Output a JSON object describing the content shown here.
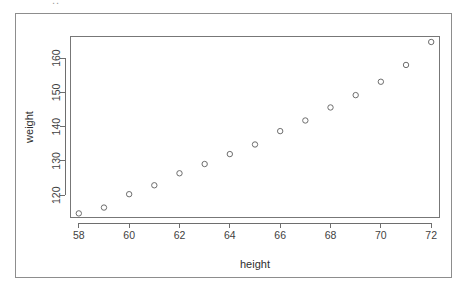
{
  "figure": {
    "top_fragment_text": "..",
    "background_color": "#ffffff",
    "frame_color": "#8d8d8d"
  },
  "chart_data": {
    "type": "scatter",
    "title": "",
    "xlabel": "height",
    "ylabel": "weight",
    "x": [
      58,
      59,
      60,
      61,
      62,
      63,
      64,
      65,
      66,
      67,
      68,
      69,
      70,
      71,
      72
    ],
    "y": [
      114.7,
      116.4,
      120.3,
      122.9,
      126.4,
      129.1,
      132.0,
      134.8,
      138.7,
      141.8,
      145.6,
      149.2,
      153.1,
      158.0,
      164.7
    ],
    "points": [
      {
        "height": 58,
        "weight": 114.7
      },
      {
        "height": 59,
        "weight": 116.4
      },
      {
        "height": 60,
        "weight": 120.3
      },
      {
        "height": 61,
        "weight": 122.9
      },
      {
        "height": 62,
        "weight": 126.4
      },
      {
        "height": 63,
        "weight": 129.1
      },
      {
        "height": 64,
        "weight": 132.0
      },
      {
        "height": 65,
        "weight": 134.8
      },
      {
        "height": 66,
        "weight": 138.7
      },
      {
        "height": 67,
        "weight": 141.8
      },
      {
        "height": 68,
        "weight": 145.6
      },
      {
        "height": 69,
        "weight": 149.2
      },
      {
        "height": 70,
        "weight": 153.1
      },
      {
        "height": 71,
        "weight": 158.0
      },
      {
        "height": 72,
        "weight": 164.7
      }
    ],
    "xticks": [
      58,
      60,
      62,
      64,
      66,
      68,
      70,
      72
    ],
    "xtick_labels": [
      "58",
      "60",
      "62",
      "64",
      "66",
      "68",
      "70",
      "72"
    ],
    "yticks": [
      120,
      130,
      140,
      150,
      160
    ],
    "ytick_labels": [
      "120",
      "130",
      "140",
      "150",
      "160"
    ],
    "xlim": [
      57.67,
      72.33
    ],
    "ylim": [
      113.5,
      166.3
    ],
    "grid": false,
    "legend": null,
    "marker": "open-circle",
    "marker_color": "#6d6d6d",
    "axis_color": "#6e6e6e",
    "box_style": "full-rectangle"
  }
}
